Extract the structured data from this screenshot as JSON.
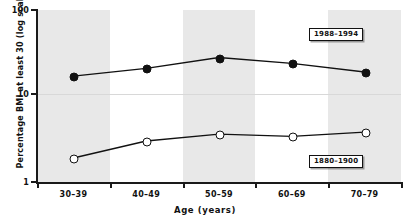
{
  "chart_data": {
    "type": "line",
    "title": "",
    "xlabel": "Age (years)",
    "ylabel": "Percentage BMI at least 30 (log scale)",
    "categories": [
      "30–39",
      "40–49",
      "50–59",
      "60–69",
      "70–79"
    ],
    "ylim": [
      1,
      100
    ],
    "yticks": [
      "1",
      "10",
      "100"
    ],
    "ytick_values": [
      1,
      10,
      100
    ],
    "log_scale": true,
    "grid": "horizontal gridline at y=10 only",
    "legend_position": "inline labels at right of each series",
    "banding": [
      "shaded",
      "white",
      "shaded",
      "white",
      "shaded"
    ],
    "series": [
      {
        "name": "1988–1994",
        "marker": "filled-circle",
        "label": "1988–1994",
        "values": [
          17,
          21,
          28,
          24,
          19
        ]
      },
      {
        "name": "1880–1900",
        "marker": "open-circle",
        "label": "1880–1900",
        "values": [
          1.9,
          3.0,
          3.6,
          3.4,
          3.8
        ]
      }
    ]
  }
}
